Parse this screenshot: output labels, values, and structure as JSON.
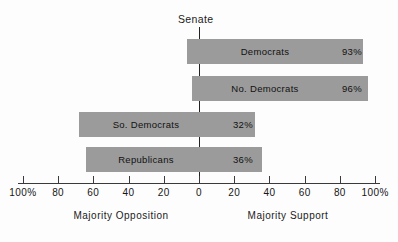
{
  "chart_data": {
    "type": "bar",
    "orientation": "horizontal",
    "title": "Senate",
    "xlabel": "",
    "ylabel": "",
    "xlim": [
      -100,
      100
    ],
    "grid": false,
    "legend": null,
    "categories": [
      "Democrats",
      "No. Democrats",
      "So. Democrats",
      "Republicans"
    ],
    "values": [
      93,
      96,
      32,
      36
    ],
    "value_labels": [
      "93%",
      "96%",
      "32%",
      "36%"
    ],
    "bars": [
      {
        "label": "Democrats",
        "value": 93,
        "value_label": "93%",
        "support": 93,
        "opposition": 7,
        "direction": "support"
      },
      {
        "label": "No. Democrats",
        "value": 96,
        "value_label": "96%",
        "support": 96,
        "opposition": 4,
        "direction": "support"
      },
      {
        "label": "So. Democrats",
        "value": 32,
        "value_label": "32%",
        "support": 32,
        "opposition": 68,
        "direction": "opposition"
      },
      {
        "label": "Republicans",
        "value": 36,
        "value_label": "36%",
        "support": 36,
        "opposition": 64,
        "direction": "opposition"
      }
    ],
    "axis_ticks": [
      {
        "value": -100,
        "label": "100%"
      },
      {
        "value": -80,
        "label": "80"
      },
      {
        "value": -60,
        "label": "60"
      },
      {
        "value": -40,
        "label": "40"
      },
      {
        "value": -20,
        "label": "20"
      },
      {
        "value": 0,
        "label": "0"
      },
      {
        "value": 20,
        "label": "20"
      },
      {
        "value": 40,
        "label": "40"
      },
      {
        "value": 60,
        "label": "60"
      },
      {
        "value": 80,
        "label": "80"
      },
      {
        "value": 100,
        "label": "100%"
      }
    ],
    "annotations": {
      "left_caption": "Majority Opposition",
      "right_caption": "Majority Support",
      "center_caption": "Senate"
    },
    "colors": {
      "bar_fill": "#9b9b9b",
      "axis": "#3a3a3a",
      "text": "#111111",
      "background": "#fdfdfd"
    }
  }
}
